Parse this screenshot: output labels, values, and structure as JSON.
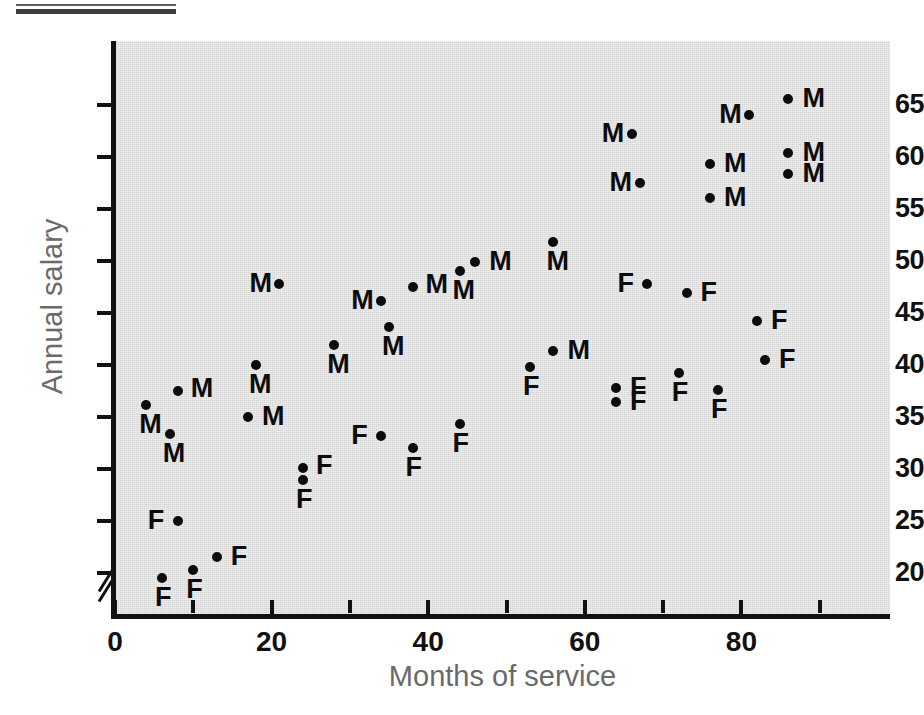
{
  "figure": {
    "x_title": "Months of service",
    "y_title": "Annual salary"
  },
  "chart_data": {
    "type": "scatter",
    "title": "",
    "xlabel": "Months of service",
    "ylabel": "Annual salary",
    "xlim": [
      0,
      99
    ],
    "ylim": [
      17,
      68
    ],
    "grid": false,
    "legend": "none",
    "axis_break": {
      "axis": "y",
      "note": "y-axis broken below 20"
    },
    "x_ticks": [
      0,
      20,
      40,
      60,
      80
    ],
    "x_minor_ticks": [
      10,
      30,
      50,
      70,
      90
    ],
    "y_ticks": [
      20,
      25,
      30,
      35,
      40,
      45,
      50,
      55,
      60,
      65
    ],
    "point_labels": [
      "M",
      "F"
    ],
    "series": [
      {
        "name": "M",
        "label": "M",
        "points": [
          {
            "x": 4,
            "y": 36.2,
            "label": "M",
            "lpos": "bl"
          },
          {
            "x": 7,
            "y": 33.4,
            "label": "M",
            "lpos": "bl"
          },
          {
            "x": 8,
            "y": 37.5,
            "label": "M",
            "lpos": "tl"
          },
          {
            "x": 17,
            "y": 35.0,
            "label": "M",
            "lpos": "r"
          },
          {
            "x": 18,
            "y": 40.0,
            "label": "M",
            "lpos": "bl"
          },
          {
            "x": 21,
            "y": 47.8,
            "label": "M",
            "lpos": "l"
          },
          {
            "x": 28,
            "y": 41.9,
            "label": "M",
            "lpos": "bl"
          },
          {
            "x": 34,
            "y": 46.2,
            "label": "M",
            "lpos": "l"
          },
          {
            "x": 35,
            "y": 43.7,
            "label": "M",
            "lpos": "bl"
          },
          {
            "x": 38,
            "y": 47.5,
            "label": "M",
            "lpos": "tl"
          },
          {
            "x": 44,
            "y": 49.0,
            "label": "M",
            "lpos": "bl"
          },
          {
            "x": 46,
            "y": 49.9,
            "label": "M",
            "lpos": "r"
          },
          {
            "x": 56,
            "y": 51.8,
            "label": "M",
            "lpos": "bl"
          },
          {
            "x": 56,
            "y": 41.3,
            "label": "M",
            "lpos": "r"
          },
          {
            "x": 66,
            "y": 62.2,
            "label": "M",
            "lpos": "l"
          },
          {
            "x": 67,
            "y": 57.5,
            "label": "M",
            "lpos": "l"
          },
          {
            "x": 76,
            "y": 59.3,
            "label": "M",
            "lpos": "r"
          },
          {
            "x": 76,
            "y": 56.1,
            "label": "M",
            "lpos": "r"
          },
          {
            "x": 81,
            "y": 64.0,
            "label": "M",
            "lpos": "l"
          },
          {
            "x": 86,
            "y": 65.6,
            "label": "M",
            "lpos": "r"
          },
          {
            "x": 86,
            "y": 60.4,
            "label": "M",
            "lpos": "r"
          },
          {
            "x": 86,
            "y": 58.4,
            "label": "M",
            "lpos": "r"
          }
        ]
      },
      {
        "name": "F",
        "label": "F",
        "points": [
          {
            "x": 6,
            "y": 19.5,
            "label": "F",
            "lpos": "bl"
          },
          {
            "x": 8,
            "y": 25.0,
            "label": "F",
            "lpos": "l"
          },
          {
            "x": 10,
            "y": 20.3,
            "label": "F",
            "lpos": "bl"
          },
          {
            "x": 13,
            "y": 21.5,
            "label": "F",
            "lpos": "r"
          },
          {
            "x": 24,
            "y": 30.1,
            "label": "F",
            "lpos": "tl"
          },
          {
            "x": 24,
            "y": 28.9,
            "label": "F",
            "lpos": "bl"
          },
          {
            "x": 34,
            "y": 33.2,
            "label": "F",
            "lpos": "l"
          },
          {
            "x": 38,
            "y": 32.0,
            "label": "F",
            "lpos": "bl"
          },
          {
            "x": 44,
            "y": 34.3,
            "label": "F",
            "lpos": "bl"
          },
          {
            "x": 53,
            "y": 39.8,
            "label": "F",
            "lpos": "bl"
          },
          {
            "x": 64,
            "y": 37.8,
            "label": "F",
            "lpos": "r"
          },
          {
            "x": 64,
            "y": 36.4,
            "label": "F",
            "lpos": "r"
          },
          {
            "x": 68,
            "y": 47.8,
            "label": "F",
            "lpos": "l"
          },
          {
            "x": 72,
            "y": 39.2,
            "label": "F",
            "lpos": "bl"
          },
          {
            "x": 73,
            "y": 46.9,
            "label": "F",
            "lpos": "r"
          },
          {
            "x": 77,
            "y": 37.6,
            "label": "F",
            "lpos": "bl"
          },
          {
            "x": 82,
            "y": 44.2,
            "label": "F",
            "lpos": "r"
          },
          {
            "x": 83,
            "y": 40.5,
            "label": "F",
            "lpos": "r"
          }
        ]
      }
    ]
  }
}
